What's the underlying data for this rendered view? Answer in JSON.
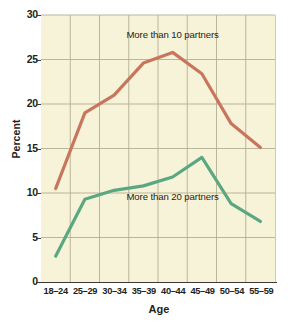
{
  "chart_data": {
    "type": "line",
    "title": "",
    "xlabel": "Age",
    "ylabel": "Percent",
    "categories": [
      "18–24",
      "25–29",
      "30–34",
      "35–39",
      "40–44",
      "45–49",
      "50–54",
      "55–59"
    ],
    "ylim": [
      0,
      30
    ],
    "yticks": [
      0,
      5,
      10,
      15,
      20,
      25,
      30
    ],
    "ytick_labels": [
      "0",
      "5",
      "10",
      "15",
      "20",
      "25",
      "30"
    ],
    "grid": true,
    "grid_color": "#b3ae93",
    "plot_background": "#f7f3d8",
    "legend_position": "inline-annotations",
    "series": [
      {
        "name": "More than 10 partners",
        "color": "#c8765e",
        "values": [
          10.5,
          19.0,
          21.0,
          24.6,
          25.8,
          23.4,
          17.8,
          15.1
        ]
      },
      {
        "name": "More than 20 partners",
        "color": "#5ba882",
        "values": [
          2.9,
          9.3,
          10.3,
          10.8,
          11.8,
          14.0,
          8.8,
          6.8
        ]
      }
    ],
    "annotations": [
      {
        "text": "More than 10 partners",
        "series": "More than 10 partners"
      },
      {
        "text": "More than 20 partners",
        "series": "More than 20 partners"
      }
    ]
  }
}
